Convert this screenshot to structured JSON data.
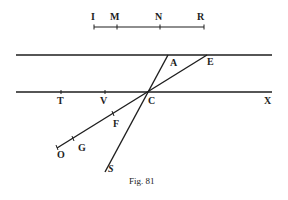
{
  "figure": {
    "caption": "Fig. 81",
    "scale_segment": {
      "labels": {
        "I": "I",
        "M": "M",
        "N": "N",
        "R": "R"
      }
    },
    "lines": {
      "top": "upper parallel line",
      "bottom": "lower parallel line through T, V, C, X"
    },
    "points": {
      "A": "A",
      "E": "E",
      "T": "T",
      "V": "V",
      "C": "C",
      "X": "X",
      "F": "F",
      "G": "G",
      "O": "O",
      "S": "S"
    },
    "colors": {
      "ink": "#1e1e1e",
      "background": "#ffffff"
    }
  }
}
